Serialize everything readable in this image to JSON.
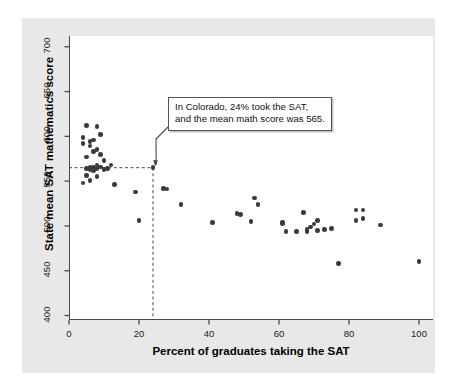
{
  "chart_data": {
    "type": "scatter",
    "title": "",
    "xlabel": "Percent of graduates taking the SAT",
    "ylabel": "State mean SAT mathematics score",
    "xlim": [
      0,
      104
    ],
    "ylim": [
      395,
      712
    ],
    "xticks": [
      0,
      20,
      40,
      60,
      80,
      100
    ],
    "yticks": [
      400,
      450,
      500,
      550,
      600,
      650,
      700
    ],
    "xtick_labels": [
      "0",
      "20",
      "40",
      "60",
      "80",
      "100"
    ],
    "ytick_labels": [
      "400",
      "450",
      "500",
      "550",
      "600",
      "650",
      "700"
    ],
    "grid": false,
    "legend": null,
    "point_color": "#3a3a3a",
    "axis_color": "#4a4a4a",
    "highlight": {
      "name": "Colorado",
      "x": 24,
      "y": 565,
      "guide_style": "dashed",
      "annotation_line1": "In Colorado, 24% took the SAT,",
      "annotation_line2": "and the mean math score was 565."
    },
    "points": [
      {
        "x": 4,
        "y": 599
      },
      {
        "x": 4,
        "y": 592
      },
      {
        "x": 4,
        "y": 548
      },
      {
        "x": 5,
        "y": 612
      },
      {
        "x": 5,
        "y": 577
      },
      {
        "x": 5,
        "y": 564
      },
      {
        "x": 5,
        "y": 556
      },
      {
        "x": 6,
        "y": 594
      },
      {
        "x": 6,
        "y": 589
      },
      {
        "x": 6,
        "y": 566
      },
      {
        "x": 6,
        "y": 563
      },
      {
        "x": 6,
        "y": 551
      },
      {
        "x": 7,
        "y": 596
      },
      {
        "x": 7,
        "y": 583
      },
      {
        "x": 7,
        "y": 565
      },
      {
        "x": 7,
        "y": 562
      },
      {
        "x": 8,
        "y": 611
      },
      {
        "x": 8,
        "y": 585
      },
      {
        "x": 8,
        "y": 568
      },
      {
        "x": 8,
        "y": 564
      },
      {
        "x": 8,
        "y": 555
      },
      {
        "x": 9,
        "y": 602
      },
      {
        "x": 9,
        "y": 580
      },
      {
        "x": 9,
        "y": 566
      },
      {
        "x": 10,
        "y": 573
      },
      {
        "x": 10,
        "y": 563
      },
      {
        "x": 11,
        "y": 564
      },
      {
        "x": 12,
        "y": 568
      },
      {
        "x": 13,
        "y": 546
      },
      {
        "x": 19,
        "y": 538
      },
      {
        "x": 20,
        "y": 506
      },
      {
        "x": 24,
        "y": 565
      },
      {
        "x": 27,
        "y": 542
      },
      {
        "x": 28,
        "y": 541
      },
      {
        "x": 32,
        "y": 524
      },
      {
        "x": 41,
        "y": 504
      },
      {
        "x": 48,
        "y": 514
      },
      {
        "x": 49,
        "y": 513
      },
      {
        "x": 52,
        "y": 505
      },
      {
        "x": 53,
        "y": 531
      },
      {
        "x": 54,
        "y": 524
      },
      {
        "x": 61,
        "y": 504
      },
      {
        "x": 61,
        "y": 503
      },
      {
        "x": 62,
        "y": 494
      },
      {
        "x": 65,
        "y": 494
      },
      {
        "x": 67,
        "y": 515
      },
      {
        "x": 68,
        "y": 496
      },
      {
        "x": 68,
        "y": 494
      },
      {
        "x": 69,
        "y": 499
      },
      {
        "x": 70,
        "y": 502
      },
      {
        "x": 71,
        "y": 506
      },
      {
        "x": 71,
        "y": 495
      },
      {
        "x": 73,
        "y": 496
      },
      {
        "x": 75,
        "y": 497
      },
      {
        "x": 77,
        "y": 458
      },
      {
        "x": 82,
        "y": 506
      },
      {
        "x": 82,
        "y": 518
      },
      {
        "x": 84,
        "y": 518
      },
      {
        "x": 84,
        "y": 508
      },
      {
        "x": 89,
        "y": 501
      },
      {
        "x": 100,
        "y": 460
      }
    ]
  }
}
